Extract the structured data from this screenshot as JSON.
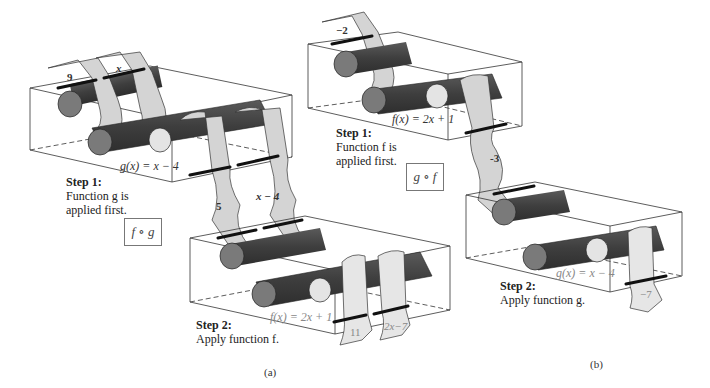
{
  "panels": [
    {
      "id": "a",
      "caption": "(a)",
      "composition": "f ∘ g",
      "step1": {
        "title": "Step 1:",
        "desc_line1": "Function g is",
        "desc_line2": "applied first.",
        "function": "g(x) = x − 4"
      },
      "step2": {
        "title": "Step 2:",
        "desc": "Apply function f.",
        "function": "f(x) = 2x + 1"
      },
      "strips": {
        "input_value": "9",
        "input_var": "x",
        "middle_value": "5",
        "middle_var": "x − 4",
        "output_value": "11",
        "output_var": "2x−7"
      }
    },
    {
      "id": "b",
      "caption": "(b)",
      "composition": "g ∘ f",
      "step1": {
        "title": "Step 1:",
        "desc_line1": "Function f is",
        "desc_line2": "applied first.",
        "function": "f(x) = 2x + 1"
      },
      "step2": {
        "title": "Step 2:",
        "desc": "Apply function g.",
        "function": "g(x) = x − 4"
      },
      "strips": {
        "input_value": "−2",
        "middle_value": "-3",
        "output_value": "−7"
      }
    }
  ],
  "colors": {
    "roller_dark": "#4a4a4a",
    "roller_end": "#7a7a7a",
    "roller_light_end": "#e4e4e4",
    "strip_fill": "#d4d4d4",
    "box_line": "#333333",
    "clamp": "#111111"
  }
}
